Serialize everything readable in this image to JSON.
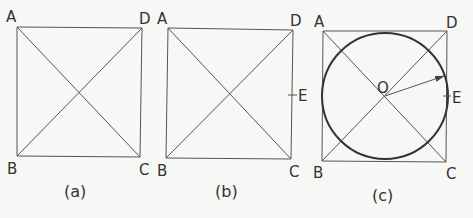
{
  "figure": {
    "panels": [
      {
        "caption": "(a)",
        "vertices": {
          "A": "A",
          "B": "B",
          "C": "C",
          "D": "D"
        }
      },
      {
        "caption": "(b)",
        "vertices": {
          "A": "A",
          "B": "B",
          "C": "C",
          "D": "D",
          "E": "E"
        }
      },
      {
        "caption": "(c)",
        "vertices": {
          "A": "A",
          "B": "B",
          "C": "C",
          "D": "D",
          "E": "E",
          "O": "O"
        }
      }
    ],
    "colors": {
      "line": "#555555",
      "circle": "#333333",
      "background": "#f7f7f5"
    }
  }
}
